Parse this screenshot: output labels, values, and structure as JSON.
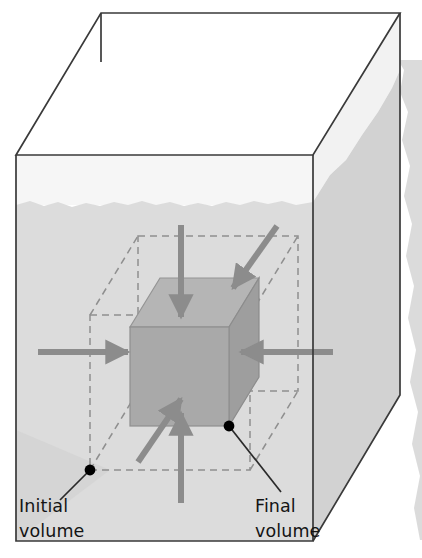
{
  "figure": {
    "container": {
      "name": "fluid-container",
      "wall_color": "#3a3a3a",
      "wall_width": 1.6,
      "interior_above_water_color": "#f4f4f4",
      "interior_below_water_color": "#d8d8d8",
      "outer_shadow_color": "#cfcfcf",
      "top_face_color": "#ffffff",
      "geometry": {
        "front_top_left": [
          16,
          155
        ],
        "front_top_right": [
          313,
          155
        ],
        "back_top_left": [
          101,
          13
        ],
        "back_top_right": [
          400,
          13
        ],
        "front_bottom_left": [
          16,
          541
        ],
        "front_bottom_right": [
          313,
          541
        ],
        "right_bevel_point": [
          400,
          395
        ]
      }
    },
    "water": {
      "name": "water-surface",
      "level_y": 203,
      "surface_label": "",
      "body_color": "#d8d8d8",
      "surface_color": "#cdcdcd",
      "wave_amplitude": 4
    },
    "initial_volume": {
      "name": "initial-volume-outline",
      "style": "dashed",
      "stroke_color": "#8a8a8a",
      "dash_pattern": "7 5",
      "front_face": {
        "x": 90,
        "y": 315,
        "w": 160,
        "h": 155
      },
      "depth_offset": {
        "dx": 48,
        "dy": -79
      }
    },
    "final_volume": {
      "name": "final-volume-cube",
      "style": "solid",
      "front_face_color": "#a8a8a8",
      "top_face_color": "#b8b8b8",
      "side_face_color": "#9d9d9d",
      "stroke_color": "#8d8d8d",
      "front_face": {
        "x": 130,
        "y": 327,
        "w": 99,
        "h": 99
      },
      "depth_offset": {
        "dx": 30,
        "dy": -49
      }
    },
    "pressure_arrows": {
      "name": "pressure-arrows",
      "color": "#8c8c8c",
      "count": 6,
      "description": "Inward-pointing arrows representing uniform fluid pressure on all faces",
      "arrows": [
        {
          "name": "pressure-arrow-left",
          "from": [
            38,
            352
          ],
          "to": [
            131,
            352
          ]
        },
        {
          "name": "pressure-arrow-right",
          "from": [
            333,
            352
          ],
          "to": [
            238,
            352
          ]
        },
        {
          "name": "pressure-arrow-top",
          "from": [
            181,
            225
          ],
          "to": [
            181,
            320
          ]
        },
        {
          "name": "pressure-arrow-bottom",
          "from": [
            181,
            503
          ],
          "to": [
            181,
            410
          ]
        },
        {
          "name": "pressure-arrow-top-right-diagonal",
          "from": [
            277,
            226
          ],
          "to": [
            230,
            292
          ]
        },
        {
          "name": "pressure-arrow-bottom-left-diagonal",
          "from": [
            138,
            462
          ],
          "to": [
            183,
            396
          ]
        }
      ]
    },
    "callouts": [
      {
        "name": "initial-volume-callout",
        "label_line1": "Initial",
        "label_line2": "volume",
        "dot": [
          90,
          470
        ],
        "leader_to": [
          60,
          500
        ],
        "text_x": 19,
        "text_y1": 512,
        "text_y2": 537,
        "dot_color": "#000000",
        "leader_color": "#2a2a2a"
      },
      {
        "name": "final-volume-callout",
        "label_line1": "Final",
        "label_line2": "volume",
        "dot": [
          229,
          426
        ],
        "leader_to": [
          281,
          488
        ],
        "text_x": 255,
        "text_y1": 512,
        "text_y2": 537,
        "dot_color": "#000000",
        "leader_color": "#2a2a2a"
      }
    ]
  }
}
